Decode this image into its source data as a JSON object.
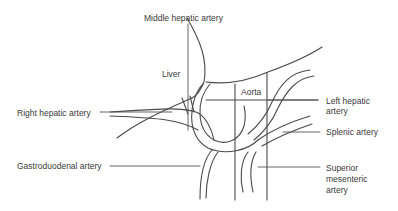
{
  "figure": {
    "type": "anatomical-line-diagram",
    "labels": {
      "middle_hepatic_artery": "Middle hepatic artery",
      "liver": "Liver",
      "aorta": "Aorta",
      "right_hepatic_artery": "Right hepatic artery",
      "left_hepatic_artery_line1": "Left hepatic",
      "left_hepatic_artery_line2": "artery",
      "splenic_artery": "Splenic artery",
      "gastroduodenal_artery": "Gastroduodenal artery",
      "superior_mesenteric_line1": "Superior",
      "superior_mesenteric_line2": "mesenteric",
      "superior_mesenteric_line3": "artery"
    },
    "colors": {
      "line": "#4a4a4a",
      "text": "#3a3a3a",
      "background": "#ffffff"
    }
  }
}
